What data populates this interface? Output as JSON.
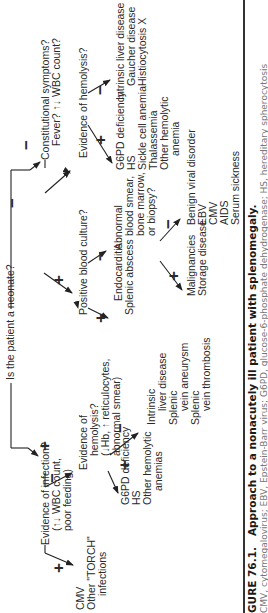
{
  "figure": {
    "caption_label": "GURE 76.1.",
    "caption_title": "Approach to a nonacutely ill patient with splenomegaly.",
    "caption_subtext": "CMV, cytomegalovirus; EBV, Epstein-Barr virus; G6PD, glucose-6-phosphate dehydrogenase; HS, hereditary spherocytosis"
  },
  "signs": {
    "plus": "+",
    "minus": "−"
  },
  "root": {
    "question": "Is the patient a neonate?"
  },
  "neonate_yes": {
    "question": [
      "Evidence of infection?",
      "(↑↓ WBC count,",
      "poor feeding)"
    ],
    "yes_outcomes": [
      "CMV",
      "Other \"TORCH\"",
      "infections"
    ],
    "no_question": [
      "Evidence of",
      "hemolysis?",
      "(↓Hb, ↑ reticulocytes,",
      "abnormal smear)"
    ],
    "hemolysis_yes": [
      "G6PD deficiency",
      "HS",
      "Other hemolytic",
      "anemias"
    ],
    "hemolysis_no": [
      "Intrinsic",
      "liver disease",
      "Splenic",
      "vein aneurysm",
      "Splenic",
      "vein thrombosis"
    ]
  },
  "neonate_no": {
    "question": [
      "Constitutional symptoms?",
      "Fever? ↑↓ WBC count?"
    ],
    "culture_question": "Positive blood culture?",
    "culture_yes": [
      "Endocarditis",
      "Splenic abscess"
    ],
    "culture_no_question": [
      "Abnormal",
      "blood smear,",
      "bone marrow,",
      "or biopsy?"
    ],
    "abnormal_yes": [
      "Malignancies",
      "Storage disease"
    ],
    "abnormal_no": [
      "Benign viral disorder",
      "EBV",
      "CMV",
      "AIDS",
      "Serum sickness"
    ],
    "hemolysis_question": "Evidence of hemolysis?",
    "hemolysis_yes": [
      "G6PD deficiency",
      "HS",
      "Sickle cell anemia",
      "Thalassemia",
      "Other hemolytic",
      "anemia"
    ],
    "hemolysis_no": [
      "Intrinsic liver disease",
      "Gaucher disease",
      "Histiocytosis X"
    ]
  }
}
